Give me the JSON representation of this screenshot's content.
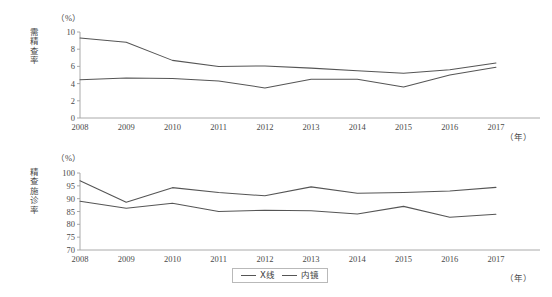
{
  "figure": {
    "background": "#ffffff",
    "line_color": "#555555",
    "axis_color": "#a0a0a0",
    "text_color": "#3a3a3a"
  },
  "legend": {
    "items": [
      {
        "label": "X线",
        "color": "#555555"
      },
      {
        "label": "内镜",
        "color": "#555555"
      }
    ]
  },
  "chart_data": [
    {
      "type": "line",
      "id": "top",
      "title": "",
      "ylabel": "需精查率",
      "xlabel": "（年）",
      "yunit": "（%）",
      "categories": [
        "2008",
        "2009",
        "2010",
        "2011",
        "2012",
        "2013",
        "2014",
        "2015",
        "2016",
        "2017"
      ],
      "x": [
        2008,
        2009,
        2010,
        2011,
        2012,
        2013,
        2014,
        2015,
        2016,
        2017
      ],
      "ylim": [
        0,
        10
      ],
      "yticks": [
        0,
        2,
        4,
        6,
        8,
        10
      ],
      "grid": false,
      "legend_position": "below-bottom-chart",
      "series": [
        {
          "name": "X线",
          "values": [
            9.3,
            8.8,
            6.7,
            6.0,
            6.05,
            5.8,
            5.5,
            5.2,
            5.6,
            6.4
          ]
        },
        {
          "name": "内镜",
          "values": [
            4.45,
            4.65,
            4.6,
            4.3,
            3.5,
            4.5,
            4.5,
            3.6,
            5.0,
            5.9
          ]
        }
      ]
    },
    {
      "type": "line",
      "id": "bottom",
      "title": "",
      "ylabel": "精查施诊率",
      "xlabel": "（年）",
      "yunit": "（%）",
      "categories": [
        "2008",
        "2009",
        "2010",
        "2011",
        "2012",
        "2013",
        "2014",
        "2015",
        "2016",
        "2017"
      ],
      "x": [
        2008,
        2009,
        2010,
        2011,
        2012,
        2013,
        2014,
        2015,
        2016,
        2017
      ],
      "ylim": [
        70,
        100
      ],
      "yticks": [
        70,
        75,
        80,
        85,
        90,
        95,
        100
      ],
      "grid": false,
      "legend_position": "bottom-center",
      "series": [
        {
          "name": "X线",
          "values": [
            97.0,
            88.6,
            94.3,
            92.4,
            91.1,
            94.6,
            92.1,
            92.4,
            93.0,
            94.4
          ]
        },
        {
          "name": "内镜",
          "values": [
            89.0,
            86.3,
            88.2,
            85.0,
            85.5,
            85.3,
            84.0,
            87.0,
            82.8,
            83.9
          ]
        }
      ]
    }
  ]
}
